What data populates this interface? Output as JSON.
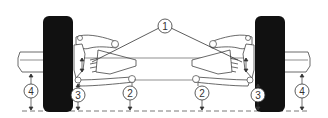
{
  "diagram": {
    "type": "front-suspension-ride-height",
    "colors": {
      "line": "#444444",
      "tire": "#111111",
      "background": "#ffffff"
    },
    "callouts": [
      {
        "id": "1",
        "label": "1",
        "x": 165,
        "y": 26
      },
      {
        "id": "2-left",
        "label": "2",
        "x": 130,
        "y": 93
      },
      {
        "id": "2-right",
        "label": "2",
        "x": 202,
        "y": 93
      },
      {
        "id": "3-left",
        "label": "3",
        "x": 78,
        "y": 95
      },
      {
        "id": "3-right",
        "label": "3",
        "x": 258,
        "y": 95
      },
      {
        "id": "4-left",
        "label": "4",
        "x": 31,
        "y": 91
      },
      {
        "id": "4-right",
        "label": "4",
        "x": 302,
        "y": 91
      }
    ]
  }
}
